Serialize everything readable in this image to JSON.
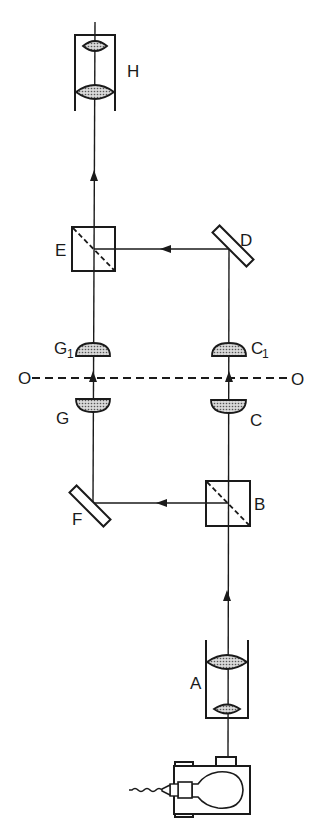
{
  "diagram": {
    "type": "optical-path-schematic",
    "colors": {
      "ink": "#1a1a1a",
      "background": "#ffffff",
      "lens_fill": "stippled gray"
    },
    "labels": {
      "H": "H",
      "E": "E",
      "D": "D",
      "G1_main": "G",
      "G1_sub": "1",
      "C1_main": "C",
      "C1_sub": "1",
      "O_left": "O",
      "O_right": "O",
      "G": "G",
      "C": "C",
      "F": "F",
      "B": "B",
      "A": "A"
    },
    "components": [
      {
        "id": "lamp",
        "label": "",
        "description": "lamp housing with light bulb and power cord"
      },
      {
        "id": "A",
        "label": "A",
        "description": "condenser (two lenses in tube)"
      },
      {
        "id": "B",
        "label": "B",
        "description": "beam-splitter cube"
      },
      {
        "id": "C",
        "label": "C",
        "description": "lens below object plane (right path)"
      },
      {
        "id": "C1",
        "label": "C1",
        "description": "lens above object plane (right path)"
      },
      {
        "id": "D",
        "label": "D",
        "description": "mirror"
      },
      {
        "id": "E",
        "label": "E",
        "description": "beam-combiner cube"
      },
      {
        "id": "F",
        "label": "F",
        "description": "mirror"
      },
      {
        "id": "G",
        "label": "G",
        "description": "lens below object plane (left path)"
      },
      {
        "id": "G1",
        "label": "G1",
        "description": "lens above object plane (left path)"
      },
      {
        "id": "H",
        "label": "H",
        "description": "eyepiece (two lenses in tube)"
      },
      {
        "id": "O-O",
        "label": "O — O",
        "description": "object plane (dashed line)"
      }
    ],
    "light_path": [
      "lamp",
      "A",
      "B",
      "C",
      "O-O",
      "C1",
      "D",
      "E",
      "H",
      "B",
      "F",
      "G",
      "O-O",
      "G1",
      "E"
    ]
  }
}
